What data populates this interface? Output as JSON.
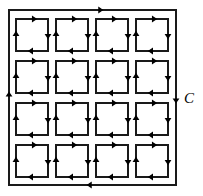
{
  "figure": {
    "kind": "oriented-grid-diagram",
    "width": 203,
    "height": 196,
    "background_color": "#ffffff",
    "stroke_color": "#1a1a1a",
    "arrow_color": "#000000"
  },
  "outer_curve": {
    "label": "C",
    "label_x": 184,
    "label_y": 103,
    "orientation": "clockwise",
    "x": 9,
    "y": 10,
    "width": 167,
    "height": 175,
    "stroke_width": 1.1,
    "arrows": [
      {
        "edge": "top",
        "direction": "right",
        "t": 0.55
      },
      {
        "edge": "right",
        "direction": "down",
        "t": 0.52
      },
      {
        "edge": "bottom",
        "direction": "left",
        "t": 0.52
      },
      {
        "edge": "left",
        "direction": "up",
        "t": 0.52
      }
    ]
  },
  "grid": {
    "rows": 4,
    "cols": 4,
    "cell_orientation": "clockwise",
    "cell_size": 32,
    "gap_x": 8,
    "gap_y": 10,
    "origin_x": 16,
    "origin_y": 19,
    "stroke_width": 1.1,
    "cell_arrows": [
      {
        "edge": "top",
        "direction": "right",
        "t": 0.58
      },
      {
        "edge": "right",
        "direction": "down",
        "t": 0.55
      },
      {
        "edge": "bottom",
        "direction": "left",
        "t": 0.55
      },
      {
        "edge": "left",
        "direction": "up",
        "t": 0.55
      }
    ]
  }
}
